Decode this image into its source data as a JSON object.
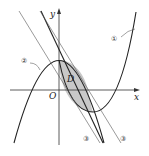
{
  "figure": {
    "axes": {
      "x_label": "x",
      "y_label": "y",
      "origin_label": "O"
    },
    "region_label": "D",
    "curve_labels": {
      "curve_1": "①",
      "curve_2": "②",
      "line_3a": "③",
      "line_3b": "③"
    },
    "colors": {
      "stroke": "#222222",
      "region_fill": "#c8c8c8",
      "thin_line": "#555555"
    }
  }
}
